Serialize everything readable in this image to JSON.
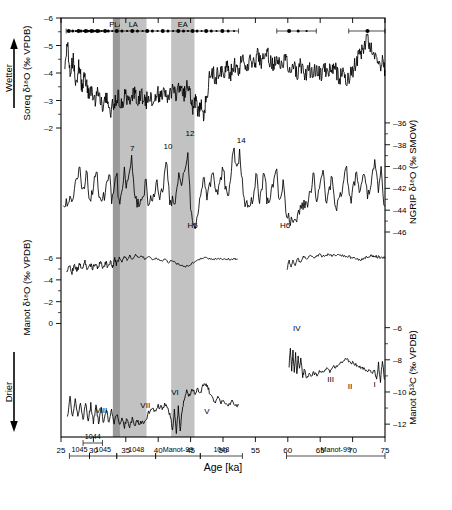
{
  "figure": {
    "xaxis": {
      "title": "Age [ka]",
      "min": 25,
      "max": 75,
      "ticks": [
        25,
        30,
        35,
        40,
        45,
        50,
        55,
        60,
        65,
        70,
        75
      ],
      "tick_labels": [
        "25",
        "30",
        "35",
        "40",
        "45",
        "50",
        "55",
        "60",
        "65",
        "70",
        "75"
      ]
    },
    "arrows": {
      "top_label": "Wetter",
      "bottom_label": "Drier"
    },
    "bands": [
      {
        "name": "PLA",
        "label": "PLA",
        "start": 33.0,
        "end": 34.1,
        "color": "#9a9a9a"
      },
      {
        "name": "LA",
        "label": "LA",
        "start": 34.1,
        "end": 38.2,
        "color": "#c2c2c2"
      },
      {
        "name": "EA",
        "label": "EA",
        "start": 42.0,
        "end": 45.6,
        "color": "#c2c2c2"
      }
    ],
    "panels": [
      {
        "id": "soreq",
        "axis_label": "Soreq δ¹⁸O (‰ VPDB)",
        "axis_side": "left",
        "ticks": [
          -6,
          -5,
          -4,
          -3,
          -2
        ],
        "tick_labels": [
          "–6",
          "–5",
          "–4",
          "–3",
          "–2"
        ],
        "ymin": -6,
        "ymax": -2,
        "inverted": true,
        "annotations": []
      },
      {
        "id": "ngrip",
        "axis_label": "NGRIP δ¹⁸O (‰ SMOW)",
        "axis_side": "right",
        "ticks": [
          -36,
          -38,
          -40,
          -42,
          -44,
          -46
        ],
        "tick_labels": [
          "–36",
          "–38",
          "–40",
          "–42",
          "–44",
          "–46"
        ],
        "ymin": -46,
        "ymax": -35,
        "inverted": false,
        "annotations": [
          {
            "text": "7",
            "x": 36.0,
            "y": -38.6
          },
          {
            "text": "10",
            "x": 41.5,
            "y": -38.4
          },
          {
            "text": "12",
            "x": 44.9,
            "y": -37.2
          },
          {
            "text": "14",
            "x": 52.8,
            "y": -37.8
          },
          {
            "text": "H5",
            "x": 45.3,
            "y": -45.6
          },
          {
            "text": "H6",
            "x": 59.6,
            "y": -45.6
          }
        ]
      },
      {
        "id": "manot_o18",
        "axis_label": "Manot δ¹⁸O (‰ VPDB)",
        "axis_side": "left",
        "ticks": [
          -6,
          -4,
          -2,
          0
        ],
        "tick_labels": [
          "–6",
          "–4",
          "–2",
          "0"
        ],
        "ymin": -7.2,
        "ymax": 0.6,
        "inverted": true,
        "annotations": []
      },
      {
        "id": "manot_c13",
        "axis_label": "Manot δ¹³C (‰ VPDB)",
        "axis_side": "right",
        "ticks": [
          -12,
          -10,
          -8,
          -6
        ],
        "tick_labels": [
          "–12",
          "–10",
          "–8",
          "–6"
        ],
        "ymin": -12.8,
        "ymax": -5.4,
        "inverted": false,
        "annotations": [
          {
            "text": "VIII",
            "x": 31.2,
            "y": -11.3
          },
          {
            "text": "VII",
            "x": 38.0,
            "y": -11.0
          },
          {
            "text": "VI",
            "x": 42.6,
            "y": -10.2
          },
          {
            "text": "V",
            "x": 47.5,
            "y": -11.4
          },
          {
            "text": "IV",
            "x": 61.4,
            "y": -6.2
          },
          {
            "text": "III",
            "x": 66.6,
            "y": -9.4
          },
          {
            "text": "II",
            "x": 69.6,
            "y": -9.8
          },
          {
            "text": "I",
            "x": 73.4,
            "y": -9.7
          }
        ]
      }
    ],
    "sample_bars": {
      "upper_row": [
        {
          "label": "1044",
          "start": 28.4,
          "end": 31.4
        }
      ],
      "lower_row": [
        {
          "label": "1045",
          "start": 26.3,
          "end": 29.4
        },
        {
          "label": "1045",
          "start": 29.4,
          "end": 33.6
        },
        {
          "label": "1048",
          "start": 33.6,
          "end": 39.6
        },
        {
          "label": "Manot-99",
          "start": 39.6,
          "end": 46.5
        },
        {
          "label": "1048",
          "start": 46.5,
          "end": 53.0
        },
        {
          "label": "Manot-99",
          "start": 59.8,
          "end": 75.0
        }
      ]
    },
    "dating_markers": {
      "description": "U-Th dating points with error bars along top of Soreq panel",
      "segments": [
        {
          "start": 25.8,
          "end": 52.4
        },
        {
          "start": 58.3,
          "end": 64.4
        },
        {
          "start": 69.4,
          "end": 75.0
        }
      ],
      "points": [
        26.2,
        26.8,
        27.3,
        27.7,
        28.1,
        28.5,
        28.8,
        29.1,
        29.4,
        29.7,
        30.0,
        30.3,
        30.6,
        30.9,
        31.3,
        31.8,
        32.3,
        32.9,
        33.6,
        34.4,
        35.2,
        36.0,
        36.8,
        37.6,
        38.3,
        39.1,
        39.9,
        40.7,
        41.5,
        42.3,
        43.1,
        43.9,
        44.6,
        45.3,
        46.0,
        46.7,
        47.4,
        48.2,
        49.0,
        49.9,
        50.8,
        51.7,
        60.2,
        61.6,
        62.9,
        72.3
      ]
    }
  },
  "chart_data": {
    "type": "line",
    "title": "",
    "xlabel": "Age [ka]",
    "xlim": [
      25,
      75
    ],
    "series": [
      {
        "name": "Soreq δ¹⁸O (‰ VPDB)",
        "panel": "soreq",
        "ylim": [
          -6,
          -2
        ],
        "inverted": true
      },
      {
        "name": "NGRIP δ¹⁸O (‰ SMOW)",
        "panel": "ngrip",
        "ylim": [
          -46,
          -35
        ],
        "inverted": false
      },
      {
        "name": "Manot δ¹⁸O (‰ VPDB)",
        "panel": "manot_o18",
        "ylim": [
          -7.2,
          0.6
        ],
        "inverted": true
      },
      {
        "name": "Manot δ¹³C (‰ VPDB)",
        "panel": "manot_c13",
        "ylim": [
          -12.8,
          -5.4
        ],
        "inverted": false
      }
    ],
    "grid": false,
    "legend": "none"
  }
}
